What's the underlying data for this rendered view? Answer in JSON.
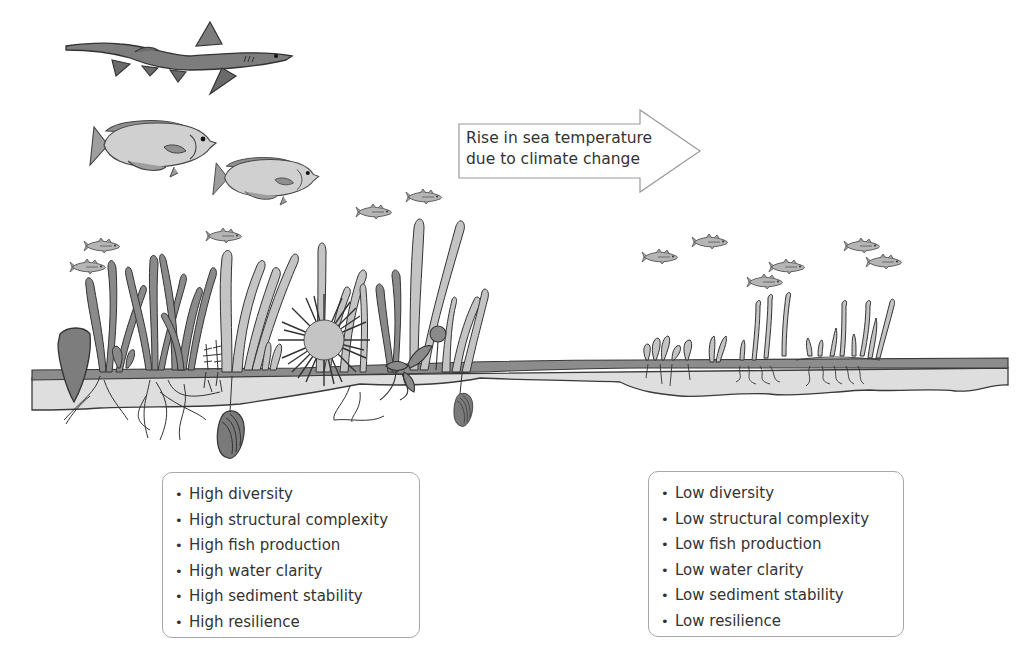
{
  "colors": {
    "outline": "#3a3a3a",
    "dark_gray": "#6e6e6e",
    "mid_gray": "#9a9a9a",
    "light_gray": "#c9c9c9",
    "sediment": "#dcdcdc",
    "box_border": "#a8a8a8",
    "text": "#333333"
  },
  "arrow": {
    "line1": "Rise in sea temperature",
    "line2": "due to climate change"
  },
  "healthy_state": {
    "items": [
      {
        "bullet": "•",
        "label": "High diversity"
      },
      {
        "bullet": "•",
        "label": "High structural complexity"
      },
      {
        "bullet": "•",
        "label": "High fish production"
      },
      {
        "bullet": "•",
        "label": "High water clarity"
      },
      {
        "bullet": "•",
        "label": "High sediment stability"
      },
      {
        "bullet": "•",
        "label": "High resilience"
      }
    ]
  },
  "degraded_state": {
    "items": [
      {
        "bullet": "•",
        "label": "Low diversity"
      },
      {
        "bullet": "•",
        "label": "Low structural complexity"
      },
      {
        "bullet": "•",
        "label": "Low fish production"
      },
      {
        "bullet": "•",
        "label": "Low water clarity"
      },
      {
        "bullet": "•",
        "label": "Low sediment stability"
      },
      {
        "bullet": "•",
        "label": "Low resilience"
      }
    ]
  },
  "illustration": {
    "left_scene": [
      "shark",
      "large-fish",
      "large-fish",
      "small-fish x5",
      "seagrass",
      "pen-shell",
      "sea-urchin",
      "mussel",
      "mussel"
    ],
    "right_scene": [
      "small-fish x6",
      "sparse-seagrass"
    ]
  }
}
